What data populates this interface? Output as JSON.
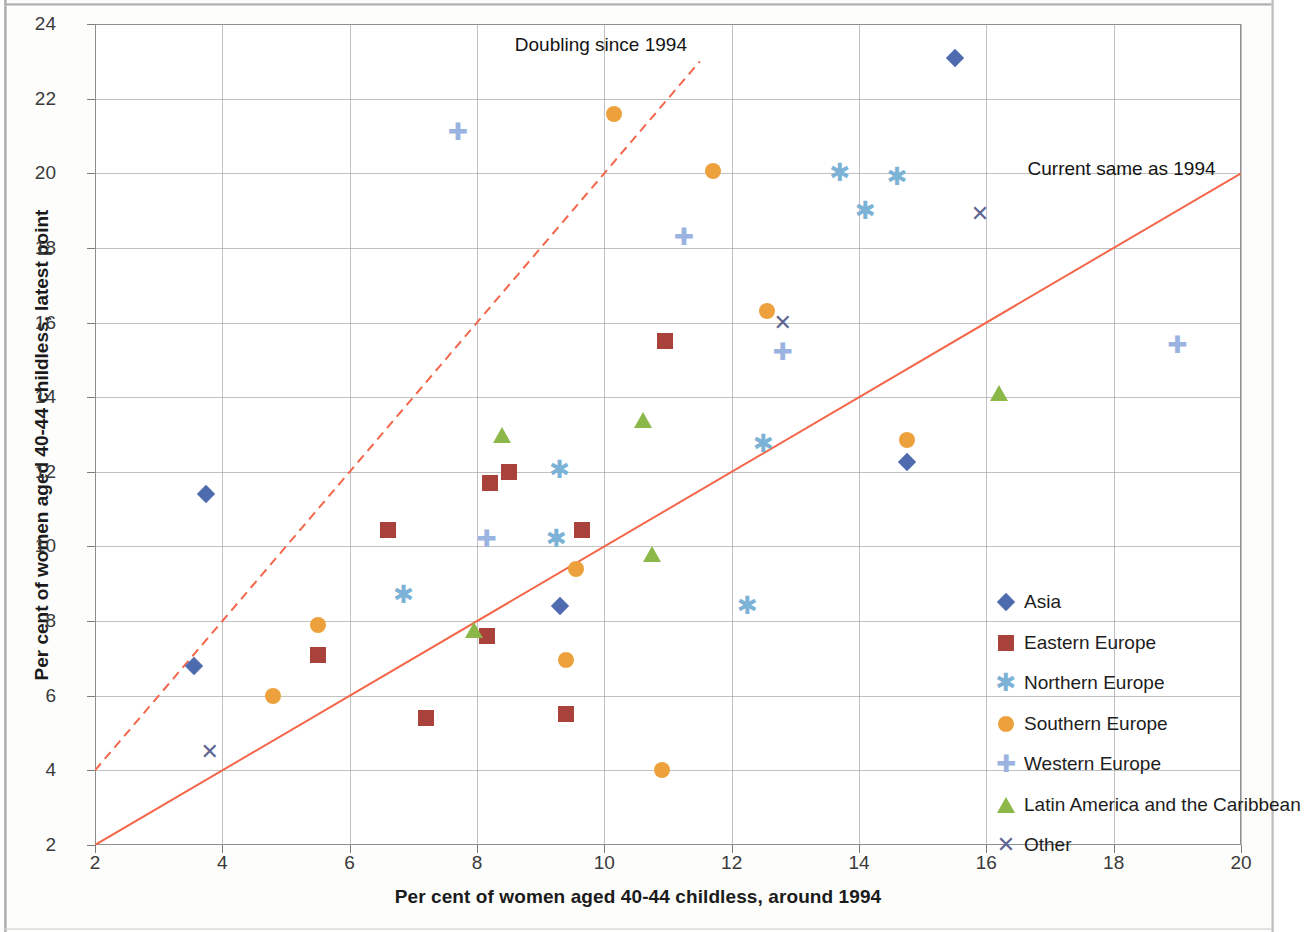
{
  "chart_data": {
    "type": "scatter",
    "title": "",
    "xlabel": "Per cent of women aged 40-44 childless, around 1994",
    "ylabel": "Per cent of women aged 40-44 childless, latest point",
    "xlim": [
      2,
      20
    ],
    "ylim": [
      2,
      24
    ],
    "xticks": [
      2,
      4,
      6,
      8,
      10,
      12,
      14,
      16,
      18,
      20
    ],
    "yticks": [
      2,
      4,
      6,
      8,
      10,
      12,
      14,
      16,
      18,
      20,
      22,
      24
    ],
    "grid": true,
    "legend_position": "inside-bottom-right",
    "annotations": [
      {
        "text": "Doubling  since 1994",
        "x": 10.4,
        "y": 23.4
      },
      {
        "text": "Current same as 1994",
        "x": 19.6,
        "y": 20.1
      }
    ],
    "reference_lines": [
      {
        "name": "Doubling since 1994",
        "equation": "y = 2x",
        "style": "dashed",
        "color": "#f4664a",
        "from": [
          2,
          4
        ],
        "to": [
          11.5,
          23
        ]
      },
      {
        "name": "Current same as 1994",
        "equation": "y = x",
        "style": "solid",
        "color": "#f4664a",
        "from": [
          2,
          2
        ],
        "to": [
          20,
          20
        ]
      }
    ],
    "series": [
      {
        "name": "Asia",
        "marker": "diamond",
        "color": "#4f6bb0",
        "points": [
          {
            "x": 15.5,
            "y": 23.1
          },
          {
            "x": 14.75,
            "y": 12.25
          },
          {
            "x": 9.3,
            "y": 8.4
          },
          {
            "x": 3.75,
            "y": 11.4
          },
          {
            "x": 3.55,
            "y": 6.8
          }
        ]
      },
      {
        "name": "Eastern Europe",
        "marker": "square",
        "color": "#a8423a",
        "points": [
          {
            "x": 10.95,
            "y": 15.5
          },
          {
            "x": 8.5,
            "y": 12.0
          },
          {
            "x": 8.2,
            "y": 11.7
          },
          {
            "x": 9.65,
            "y": 10.45
          },
          {
            "x": 6.6,
            "y": 10.45
          },
          {
            "x": 8.15,
            "y": 7.6
          },
          {
            "x": 5.5,
            "y": 7.1
          },
          {
            "x": 9.4,
            "y": 5.5
          },
          {
            "x": 7.2,
            "y": 5.4
          }
        ]
      },
      {
        "name": "Northern Europe",
        "marker": "asterisk",
        "color": "#7cb2d6",
        "points": [
          {
            "x": 13.7,
            "y": 20.0
          },
          {
            "x": 14.6,
            "y": 19.9
          },
          {
            "x": 14.1,
            "y": 19.0
          },
          {
            "x": 12.5,
            "y": 12.75
          },
          {
            "x": 9.3,
            "y": 12.05
          },
          {
            "x": 9.25,
            "y": 10.2
          },
          {
            "x": 12.25,
            "y": 8.4
          },
          {
            "x": 6.85,
            "y": 8.7
          }
        ]
      },
      {
        "name": "Southern Europe",
        "marker": "circle",
        "color": "#eda13c",
        "points": [
          {
            "x": 10.15,
            "y": 21.6
          },
          {
            "x": 11.7,
            "y": 20.05
          },
          {
            "x": 12.55,
            "y": 16.3
          },
          {
            "x": 14.75,
            "y": 12.85
          },
          {
            "x": 9.55,
            "y": 9.4
          },
          {
            "x": 5.5,
            "y": 7.9
          },
          {
            "x": 9.4,
            "y": 6.95
          },
          {
            "x": 4.8,
            "y": 6.0
          },
          {
            "x": 10.9,
            "y": 4.0
          }
        ]
      },
      {
        "name": "Western Europe",
        "marker": "plus",
        "color": "#9bb3e0",
        "points": [
          {
            "x": 7.7,
            "y": 21.1
          },
          {
            "x": 11.25,
            "y": 18.3
          },
          {
            "x": 19.0,
            "y": 15.4
          },
          {
            "x": 12.8,
            "y": 15.2
          },
          {
            "x": 8.15,
            "y": 10.2
          }
        ]
      },
      {
        "name": "Latin America and the Caribbean",
        "marker": "triangle",
        "color": "#8cb849",
        "points": [
          {
            "x": 16.2,
            "y": 14.1
          },
          {
            "x": 10.6,
            "y": 13.4
          },
          {
            "x": 8.4,
            "y": 13.0
          },
          {
            "x": 10.75,
            "y": 9.8
          },
          {
            "x": 7.95,
            "y": 7.75
          }
        ]
      },
      {
        "name": "Other",
        "marker": "x",
        "color": "#5f6694",
        "points": [
          {
            "x": 15.9,
            "y": 18.9
          },
          {
            "x": 12.8,
            "y": 16.0
          },
          {
            "x": 3.8,
            "y": 4.5
          }
        ]
      }
    ]
  },
  "axes": {
    "x_title": "Per cent of women aged 40-44 childless, around 1994",
    "y_title": "Per cent of women aged 40-44 childless, latest point"
  },
  "legend": {
    "items": [
      {
        "label": "Asia",
        "marker": "diamond",
        "color": "#4f6bb0"
      },
      {
        "label": "Eastern Europe",
        "marker": "square",
        "color": "#a8423a"
      },
      {
        "label": "Northern Europe",
        "marker": "asterisk",
        "color": "#7cb2d6"
      },
      {
        "label": "Southern Europe",
        "marker": "circle",
        "color": "#eda13c"
      },
      {
        "label": "Western Europe",
        "marker": "plus",
        "color": "#9bb3e0"
      },
      {
        "label": "Latin America and the Caribbean",
        "marker": "triangle",
        "color": "#8cb849"
      },
      {
        "label": "Other",
        "marker": "x",
        "color": "#5f6694"
      }
    ]
  },
  "annotations": {
    "doubling": "Doubling  since 1994",
    "current_same": "Current same as 1994"
  }
}
